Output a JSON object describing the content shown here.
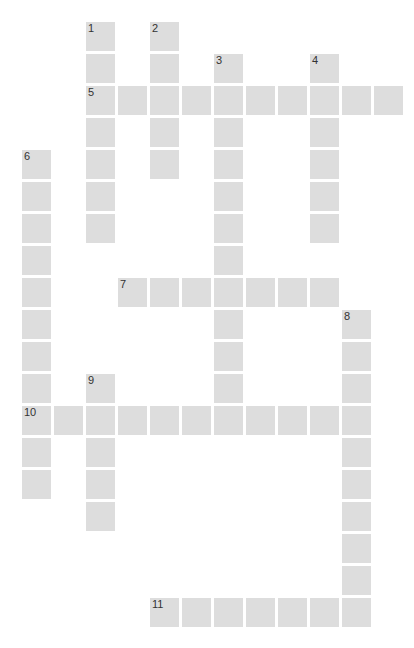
{
  "puzzle": {
    "type": "crossword",
    "origin_x": 22,
    "origin_y": 22,
    "pitch_x": 32,
    "pitch_y": 32,
    "cell_color": "#dddddd",
    "number_color": "#333333",
    "background": "#ffffff"
  },
  "entries": [
    {
      "number": "1",
      "direction": "down",
      "col": 2,
      "row": 0,
      "length": 7
    },
    {
      "number": "2",
      "direction": "down",
      "col": 4,
      "row": 0,
      "length": 5
    },
    {
      "number": "3",
      "direction": "down",
      "col": 6,
      "row": 1,
      "length": 12
    },
    {
      "number": "4",
      "direction": "down",
      "col": 9,
      "row": 1,
      "length": 6
    },
    {
      "number": "5",
      "direction": "across",
      "col": 2,
      "row": 2,
      "length": 10
    },
    {
      "number": "6",
      "direction": "down",
      "col": 0,
      "row": 4,
      "length": 11
    },
    {
      "number": "7",
      "direction": "across",
      "col": 3,
      "row": 8,
      "length": 7
    },
    {
      "number": "8",
      "direction": "down",
      "col": 10,
      "row": 9,
      "length": 10
    },
    {
      "number": "9",
      "direction": "down",
      "col": 2,
      "row": 11,
      "length": 5
    },
    {
      "number": "10",
      "direction": "across",
      "col": 0,
      "row": 12,
      "length": 11
    },
    {
      "number": "11",
      "direction": "across",
      "col": 4,
      "row": 18,
      "length": 7
    }
  ]
}
